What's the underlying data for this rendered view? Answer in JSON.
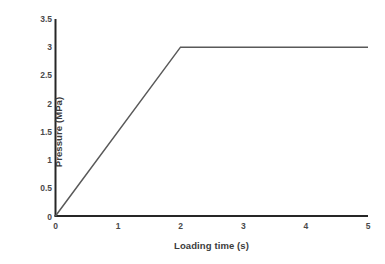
{
  "chart_data": {
    "type": "line",
    "title": "",
    "xlabel": "Loading time (s)",
    "ylabel": "Pressure (MPa)",
    "xlim": [
      0,
      5
    ],
    "ylim": [
      0,
      3.5
    ],
    "x_ticks": [
      0,
      1,
      2,
      3,
      4,
      5
    ],
    "x_tick_labels": [
      "0",
      "1",
      "2",
      "3",
      "4",
      "5"
    ],
    "y_ticks": [
      0,
      0.5,
      1,
      1.5,
      2,
      2.5,
      3,
      3.5
    ],
    "y_tick_labels": [
      "0",
      "0.5",
      "1",
      "1.5",
      "2",
      "2.5",
      "3",
      "3.5"
    ],
    "grid": false,
    "legend": false,
    "legend_position": "none",
    "series": [
      {
        "name": "Pressure",
        "color": "#595959",
        "line_width": 1.5,
        "x": [
          0,
          2,
          5
        ],
        "values": [
          0,
          3,
          3
        ],
        "points": [
          {
            "x": 0,
            "y": 0
          },
          {
            "x": 2,
            "y": 3
          },
          {
            "x": 5,
            "y": 3
          }
        ],
        "description": "Linear ramp from 0 MPa at 0 s to 3 MPa at 2 s, then held constant at 3 MPa until 5 s"
      }
    ],
    "annotations": [],
    "colors": {
      "line": "#595959",
      "axis": "#262626",
      "tick_text": "#4a4a4a",
      "title_text": "#3b3b3b",
      "background": "#ffffff"
    }
  },
  "axes": {
    "x_title": "Loading time (s)",
    "y_title": "Pressure (MPa)"
  }
}
